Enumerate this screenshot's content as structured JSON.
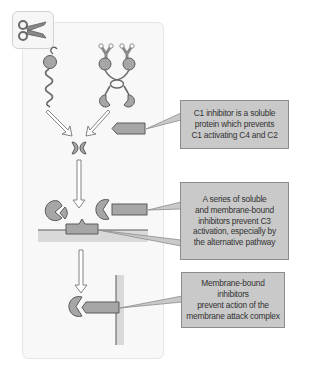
{
  "figure": {
    "corner_icon": "scissors-icon",
    "colors": {
      "protein_fill": "#a6a6a6",
      "outline": "#5a5a5a",
      "callout_fill": "#c9c9c9",
      "callout_border": "#8c8c8c",
      "membrane_fill": "#d9d9d9",
      "panel_fill": "#f8f8f8"
    },
    "callouts": [
      {
        "id": "c1-inhibitor",
        "text": "C1 inhibitor is a soluble\nprotein which prevents\nC1 activating C4 and C2"
      },
      {
        "id": "c3-inhibitors",
        "text": "A series of soluble\nand membrane-bound\ninhibitors prevent C3\nactivation, especially by\nthe alternative pathway"
      },
      {
        "id": "mac-inhibitors",
        "text": "Membrane-bound inhibitors\nprevent action of the\nmembrane attack complex"
      }
    ]
  }
}
